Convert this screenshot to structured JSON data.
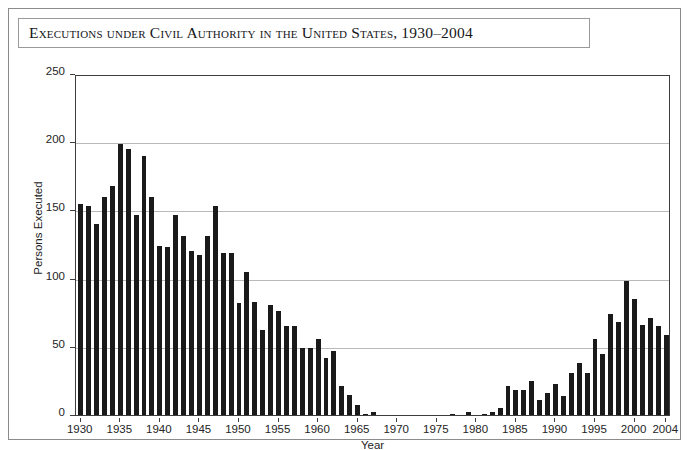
{
  "figure": {
    "title": "Executions under Civil Authority in the United States, 1930–2004",
    "axis_color": "#3d3d3d",
    "bar_color": "#1a1a1a",
    "grid_color": "#b9b9b9",
    "border_color": "#8b8b8b"
  },
  "chart_data": {
    "type": "bar",
    "title": "Executions under Civil Authority in the United States, 1930–2004",
    "xlabel": "Year",
    "ylabel": "Persons Executed",
    "xlim": [
      1929.4,
      2004.6
    ],
    "ylim": [
      0,
      250
    ],
    "yticks": [
      0,
      50,
      100,
      150,
      200,
      250
    ],
    "ytick_labels": [
      "0",
      "50",
      "100",
      "150",
      "200",
      "250"
    ],
    "xticks": [
      1930,
      1935,
      1940,
      1945,
      1950,
      1955,
      1960,
      1965,
      1970,
      1975,
      1980,
      1985,
      1990,
      1995,
      2000,
      2004
    ],
    "xtick_labels": [
      "1930",
      "1935",
      "1940",
      "1945",
      "1950",
      "1955",
      "1960",
      "1965",
      "1970",
      "1975",
      "1980",
      "1985",
      "1990",
      "1995",
      "2000",
      "2004"
    ],
    "grid": "horizontal",
    "legend": null,
    "categories": [
      1930,
      1931,
      1932,
      1933,
      1934,
      1935,
      1936,
      1937,
      1938,
      1939,
      1940,
      1941,
      1942,
      1943,
      1944,
      1945,
      1946,
      1947,
      1948,
      1949,
      1950,
      1951,
      1952,
      1953,
      1954,
      1955,
      1956,
      1957,
      1958,
      1959,
      1960,
      1961,
      1962,
      1963,
      1964,
      1965,
      1966,
      1967,
      1968,
      1969,
      1970,
      1971,
      1972,
      1973,
      1974,
      1975,
      1976,
      1977,
      1978,
      1979,
      1980,
      1981,
      1982,
      1983,
      1984,
      1985,
      1986,
      1987,
      1988,
      1989,
      1990,
      1991,
      1992,
      1993,
      1994,
      1995,
      1996,
      1997,
      1998,
      1999,
      2000,
      2001,
      2002,
      2003,
      2004
    ],
    "values": [
      155,
      153,
      140,
      160,
      168,
      199,
      195,
      147,
      190,
      160,
      124,
      123,
      147,
      131,
      120,
      117,
      131,
      153,
      119,
      119,
      82,
      105,
      83,
      62,
      81,
      76,
      65,
      65,
      49,
      49,
      56,
      42,
      47,
      21,
      15,
      7,
      1,
      2,
      0,
      0,
      0,
      0,
      0,
      0,
      0,
      0,
      0,
      1,
      0,
      2,
      0,
      1,
      2,
      5,
      21,
      18,
      18,
      25,
      11,
      16,
      23,
      14,
      31,
      38,
      31,
      56,
      45,
      74,
      68,
      98,
      85,
      66,
      71,
      65,
      59
    ]
  }
}
